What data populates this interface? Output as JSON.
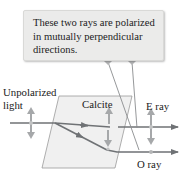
{
  "callout": {
    "lines": [
      "These two rays are polarized",
      "in mutually perpendicular",
      "directions."
    ]
  },
  "labels": {
    "input_line1": "Unpolarized",
    "input_line2": "light",
    "crystal": "Calcite",
    "e_ray": "E ray",
    "o_ray": "O ray"
  },
  "colors": {
    "ray": "#6f7275",
    "arrow": "#a6a8aa",
    "crystal_fill": "#f0f0f0",
    "crystal_edge": "#9a9a9a",
    "callout_fill": "#ebebea",
    "pointer": "#8a8c8e"
  },
  "icons": {
    "polarization_unpolarized": "double-arrow-vertical",
    "polarization_e": "double-arrow-vertical",
    "polarization_o": "dot"
  }
}
